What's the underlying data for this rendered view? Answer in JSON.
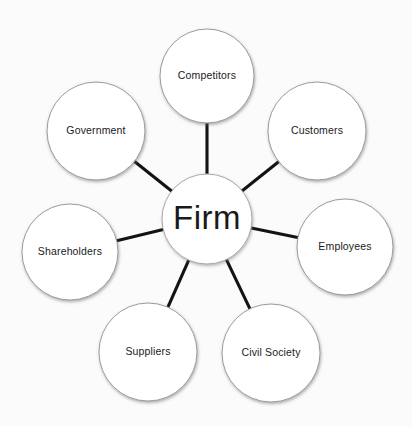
{
  "diagram": {
    "type": "hub-and-spoke stakeholder map",
    "background_color": "#fbfbfb",
    "node_fill_color": "#ffffff",
    "node_stroke_color": "#9b9b9b",
    "connector_color": "#131313",
    "text_color": "#1a1a1a",
    "center": {
      "label": "Firm",
      "cx": 207,
      "cy": 219,
      "r": 45
    },
    "satellites": [
      {
        "id": "competitors",
        "label": "Competitors",
        "cx": 207,
        "cy": 76,
        "r": 47
      },
      {
        "id": "customers",
        "label": "Customers",
        "cx": 317,
        "cy": 131,
        "r": 49
      },
      {
        "id": "employees",
        "label": "Employees",
        "cx": 345,
        "cy": 247,
        "r": 48
      },
      {
        "id": "civil-society",
        "label": "Civil Society",
        "cx": 271,
        "cy": 353,
        "r": 49
      },
      {
        "id": "suppliers",
        "label": "Suppliers",
        "cx": 148,
        "cy": 352,
        "r": 49
      },
      {
        "id": "shareholders",
        "label": "Shareholders",
        "cx": 70,
        "cy": 252,
        "r": 48
      },
      {
        "id": "government",
        "label": "Government",
        "cx": 96,
        "cy": 131,
        "r": 49
      }
    ],
    "connections": [
      {
        "from": "firm",
        "to": "competitors"
      },
      {
        "from": "firm",
        "to": "customers"
      },
      {
        "from": "firm",
        "to": "employees"
      },
      {
        "from": "firm",
        "to": "civil-society"
      },
      {
        "from": "firm",
        "to": "suppliers"
      },
      {
        "from": "firm",
        "to": "shareholders"
      },
      {
        "from": "firm",
        "to": "government"
      }
    ]
  }
}
